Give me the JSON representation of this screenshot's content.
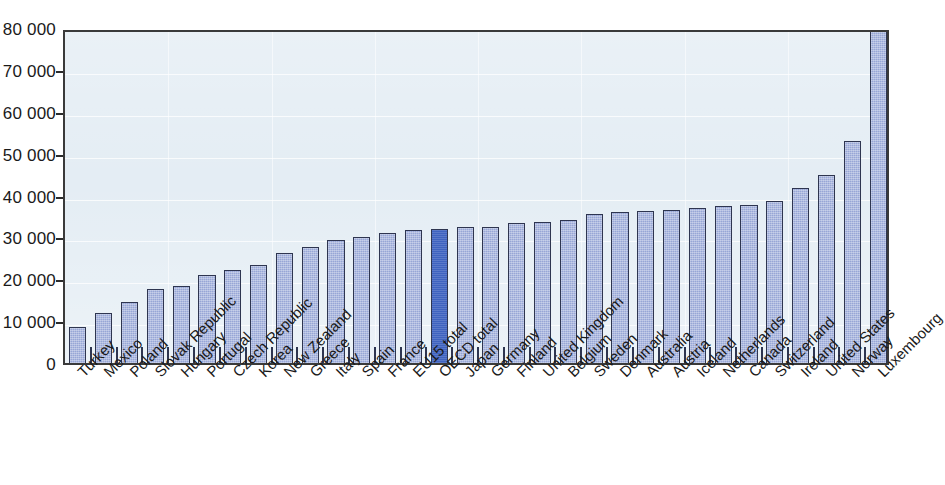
{
  "chart_data": {
    "type": "bar",
    "title": "",
    "subtitle": "",
    "xlabel": "",
    "ylabel": "",
    "ylim": [
      0,
      80000
    ],
    "ytick_labels": [
      "0",
      "10 000",
      "20 000",
      "30 000",
      "40 000",
      "50 000",
      "60 000",
      "70 000",
      "80 000"
    ],
    "ytick_values": [
      0,
      10000,
      20000,
      30000,
      40000,
      50000,
      60000,
      70000,
      80000
    ],
    "grid": true,
    "legend": "none",
    "highlight_category": "OECD total",
    "colors": {
      "bar_fill": "#97a6d6",
      "bar_highlight_fill": "#3f63c0",
      "bar_border": "#2e3550",
      "plot_background": "#e4edf4",
      "axis": "#2b2b2b",
      "text": "#1a1a1a"
    },
    "categories": [
      "Turkey",
      "Mexico",
      "Poland",
      "Slovak Republic",
      "Hungary",
      "Portugal",
      "Czech Republic",
      "Korea",
      "New Zealand",
      "Greece",
      "Italy",
      "Spain",
      "France",
      "EU15 total",
      "OECD total",
      "Japan",
      "Germany",
      "Finland",
      "United Kingdom",
      "Belgium",
      "Sweden",
      "Denmark",
      "Australia",
      "Austria",
      "Iceland",
      "Netherlands",
      "Canada",
      "Switzerland",
      "Ireland",
      "United States",
      "Norway",
      "Luxembourg"
    ],
    "values": [
      8700,
      12000,
      14600,
      17700,
      18300,
      21000,
      22300,
      23400,
      26300,
      27700,
      29300,
      30100,
      31100,
      31800,
      31900,
      32500,
      32600,
      33500,
      33700,
      34200,
      35600,
      36000,
      36300,
      36500,
      36900,
      37600,
      37700,
      38700,
      41800,
      45000,
      53000,
      79200
    ]
  }
}
